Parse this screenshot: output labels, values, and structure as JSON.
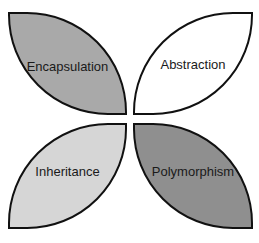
{
  "diagram": {
    "type": "four-quadrant petal diagram",
    "quadrants": [
      {
        "position": "top-left",
        "label": "Encapsulation",
        "fill": "#a9a9a9"
      },
      {
        "position": "top-right",
        "label": "Abstraction",
        "fill": "#ffffff"
      },
      {
        "position": "bottom-left",
        "label": "Inheritance",
        "fill": "#d6d6d6"
      },
      {
        "position": "bottom-right",
        "label": "Polymorphism",
        "fill": "#8f8f8f"
      }
    ],
    "outline_color": "#111111"
  }
}
